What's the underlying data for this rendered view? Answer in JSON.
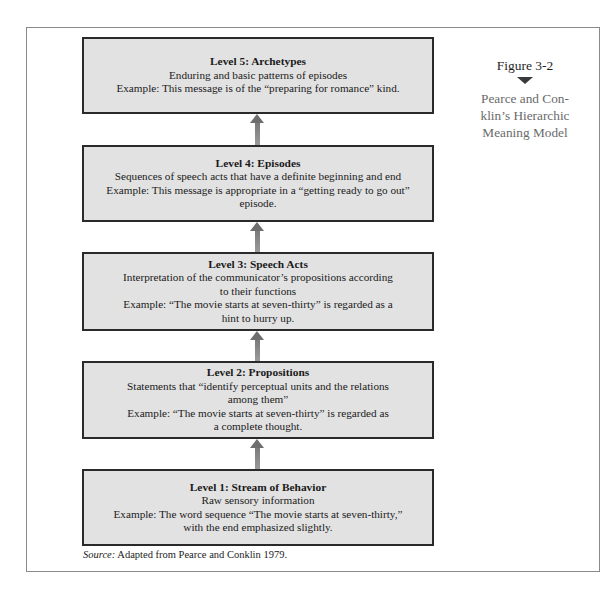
{
  "figure": {
    "number": "Figure 3-2",
    "caption_lines": [
      "Pearce and Con-",
      "klin’s Hierarchic",
      "Meaning Model"
    ]
  },
  "levels": [
    {
      "title": "Level 5:  Archetypes",
      "lines": [
        "Enduring and basic patterns of episodes",
        "Example:  This message is of the “preparing for romance” kind."
      ]
    },
    {
      "title": "Level 4:  Episodes",
      "lines": [
        "Sequences of speech acts that have a definite beginning and end",
        "Example:  This message is appropriate in a “getting ready to go out” episode."
      ]
    },
    {
      "title": "Level 3:  Speech Acts",
      "lines": [
        "Interpretation of the communicator’s propositions according",
        "to their functions",
        "Example:  “The movie starts at seven-thirty” is regarded as a",
        "hint to hurry up."
      ]
    },
    {
      "title": "Level 2:  Propositions",
      "lines": [
        "Statements that “identify perceptual units and the relations",
        "among them”",
        "Example:  “The movie starts at seven-thirty” is regarded as",
        "a complete thought."
      ]
    },
    {
      "title": "Level 1:  Stream of Behavior",
      "lines": [
        "Raw sensory information",
        "Example: The word sequence “The movie starts at seven-thirty,”",
        "with the end emphasized slightly."
      ]
    }
  ],
  "source": {
    "label": "Source:",
    "text": " Adapted from Pearce and Conklin 1979."
  },
  "colors": {
    "box_fill": "#e2e2e2",
    "box_border": "#2a2a2a",
    "arrow": "#7a7a7a",
    "caption": "#6a6a6a",
    "frame_border": "#8a8a8a"
  }
}
